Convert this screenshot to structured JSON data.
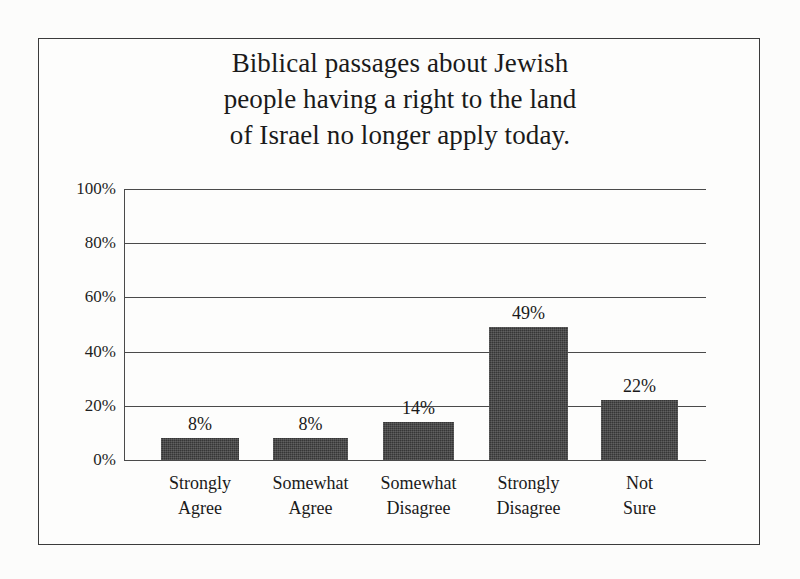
{
  "figure": {
    "title_lines": [
      "Biblical passages about Jewish",
      "people having a right to the land",
      "of Israel no longer apply today."
    ],
    "frame_color": "#3b3b3b",
    "bar_color": "#3c3c3c",
    "axis_color": "#4a4a4a",
    "background_color": "#fdfdfc"
  },
  "chart_data": {
    "type": "bar",
    "title": "Biblical passages about Jewish people having a right to the land of Israel no longer apply today.",
    "categories": [
      "Strongly Agree",
      "Somewhat Agree",
      "Somewhat Disagree",
      "Strongly Disagree",
      "Not Sure"
    ],
    "category_lines": [
      [
        "Strongly",
        "Agree"
      ],
      [
        "Somewhat",
        "Agree"
      ],
      [
        "Somewhat",
        "Disagree"
      ],
      [
        "Strongly",
        "Disagree"
      ],
      [
        "Not",
        "Sure"
      ]
    ],
    "values": [
      8,
      8,
      14,
      49,
      22
    ],
    "value_labels": [
      "8%",
      "8%",
      "14%",
      "49%",
      "22%"
    ],
    "xlabel": "",
    "ylabel": "",
    "ylim": [
      0,
      100
    ],
    "yticks": [
      0,
      20,
      40,
      60,
      80,
      100
    ],
    "ytick_labels": [
      "0%",
      "20%",
      "40%",
      "60%",
      "80%",
      "100%"
    ],
    "grid": true,
    "legend": false,
    "legend_position": "none"
  }
}
